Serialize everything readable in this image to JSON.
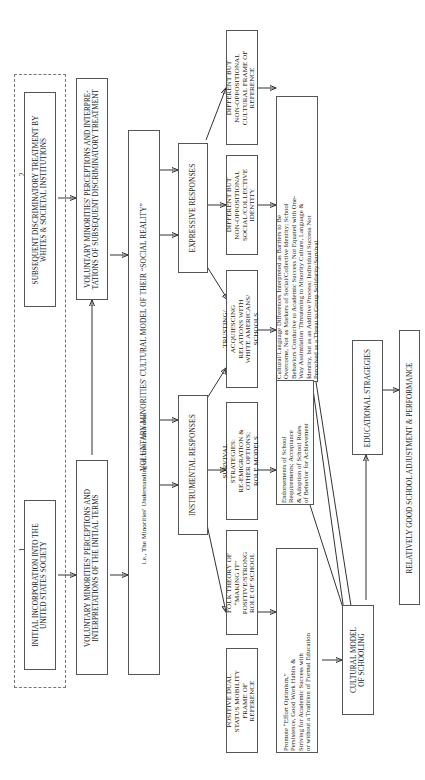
{
  "diagram": {
    "orientation": "rotated-90-ccw",
    "group_labels": {
      "one": "1",
      "two": "2"
    },
    "nodes": {
      "initial_incorporation": "INITIAL INCORPORATION INTO THE\nUNITED STATES SOCIETY",
      "subsequent_discriminatory": "SUBSEQUENT DISCRIMINATORY TREATMENT BY\nWHITES & SOCIETAL INSTITUTIONS",
      "perceptions_initial": "VOLUNTARY MINORITIES' PERCEPTIONS AND\nINTERPRETATIONS OF THE INITIAL TERMS",
      "perceptions_subsequent": "VOLUNTARY MINORITIES' PERCEPTIONS AND INTERPRE-\nTATIONS OF SUBSEQUENT DISCRIMINATORY TREATMENT",
      "cultural_model_line1": "VOLUNTARY MINORITIES' CULTURAL MODEL OF THEIR “SOCIAL REALITY”",
      "cultural_model_line2": "i.e., The Minorities' Understanding of Their Universe",
      "expressive_responses": "EXPRESSIVE RESPONSES",
      "instrumental_responses": "INSTRUMENTAL RESPONSES",
      "trusting_acquiescing": "TRUSTING/\nACQUIESCING\nRELATIONS WITH\nWHITE AMERICANS/\nSCHOOLS",
      "different_social_identity": "DIFFERENT BUT\nNON-OPPOSITIONAL\nSOCIAL/COLLECTIVE\nIDENTITY",
      "different_cultural_frame": "DIFFERENT BUT\nNON-OPPOSITIONAL\nCULTURAL FRAME OF\nREFERENCE",
      "survival_strategies": "SURVIVAL\nSTRATEGIES:\nRE-EMIGRATION &\nOTHER OPTIONS;\nROLE MODELS",
      "folk_theory": "FOLK THEORY OF\n“MAKING IT”\nPOSITIVE/STRONG\nROLE OF SCHOOL",
      "positive_dual_status": "POSITIVE DUAL\nSTATUS MOBILITY\nFRAME OF\nREFERENCE",
      "endorsements": "Endorsements of School\nRequirements; Acceptance\n& Adoption of School Rules\nof Behavior for Achievement",
      "cultural_language": "Cultural/Language Differences Interpreted as Barriers to Be\nOvercome, Not as Markers of Social/Collective Identity; School\nBehaviors Conducive to Academic Success Not Equated with One-\nWay Assimilation Threatening to Minority Culture, Language &\nIdentity, but as an Additive Process: Individual Success Not\nPerceived as a Threat to Group Solidarity/Survival",
      "effort_optimism": "Promote “Effort Optimism,”\nPersistence, Good Work Habits &\nStriving for Academic Success with\nor without a Tradition of Formal Education",
      "cultural_model_schooling": "CULTURAL MODEL\nOF SCHOOLING",
      "educational_strategies": "EDUCATIONAL STRAGEGIES",
      "school_adjustment": "RELATIVELY GOOD SCHOOL ADJUSTMENT & PERFORMANCE"
    }
  }
}
